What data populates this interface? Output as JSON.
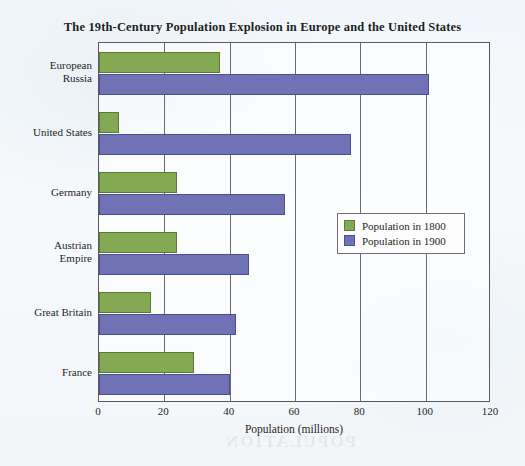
{
  "chart_data": {
    "type": "bar",
    "orientation": "horizontal",
    "title": "The 19th-Century Population Explosion in Europe and the United States",
    "xlabel": "Population (millions)",
    "ylabel": "",
    "xlim": [
      0,
      120
    ],
    "xticks": [
      0,
      20,
      40,
      60,
      80,
      100,
      120
    ],
    "grid": true,
    "legend_position": "middle-right",
    "categories": [
      "European Russia",
      "United States",
      "Germany",
      "Austrian Empire",
      "Great Britain",
      "France"
    ],
    "series": [
      {
        "name": "Population in 1800",
        "color": "#83a952",
        "values": [
          37,
          6,
          24,
          24,
          16,
          29
        ]
      },
      {
        "name": "Population in 1900",
        "color": "#6f72b4",
        "values": [
          101,
          77,
          57,
          46,
          42,
          40
        ]
      }
    ]
  },
  "category_label_lines": [
    [
      "European",
      "Russia"
    ],
    [
      "United States"
    ],
    [
      "Germany"
    ],
    [
      "Austrian",
      "Empire"
    ],
    [
      "Great Britain"
    ],
    [
      "France"
    ]
  ],
  "legend": {
    "items": [
      {
        "label": "Population in 1800",
        "color": "#83a952"
      },
      {
        "label": "Population in 1900",
        "color": "#6f72b4"
      }
    ]
  },
  "bleed_through_text": "POPULATION"
}
